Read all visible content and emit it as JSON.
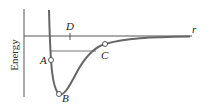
{
  "diagram": {
    "type": "potential-energy-curve",
    "y_axis_label": "Energy",
    "x_axis_label": "r",
    "points": [
      {
        "id": "A",
        "label": "A",
        "description": "point on repulsive wall at energy level of C"
      },
      {
        "id": "B",
        "label": "B",
        "description": "minimum of potential well"
      },
      {
        "id": "C",
        "label": "C",
        "description": "point on attractive side"
      },
      {
        "id": "D",
        "label": "D",
        "description": "tick mark on r-axis"
      }
    ],
    "colors": {
      "curve": "#666666",
      "axis": "#555555",
      "text": "#222222"
    }
  }
}
